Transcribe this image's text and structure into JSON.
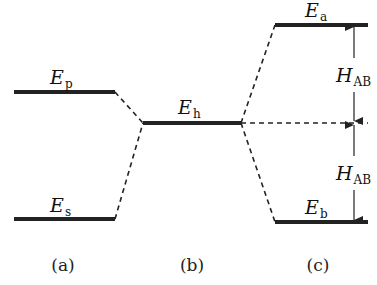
{
  "diagram": {
    "levels": {
      "p": {
        "symbol": "E",
        "sub": "p"
      },
      "s": {
        "symbol": "E",
        "sub": "s"
      },
      "h": {
        "symbol": "E",
        "sub": "h"
      },
      "a": {
        "symbol": "E",
        "sub": "a"
      },
      "b": {
        "symbol": "E",
        "sub": "b"
      }
    },
    "coupling": [
      {
        "symbol": "H",
        "sub": "AB"
      },
      {
        "symbol": "H",
        "sub": "AB"
      }
    ],
    "captions": [
      "(a)",
      "(b)",
      "(c)"
    ]
  }
}
